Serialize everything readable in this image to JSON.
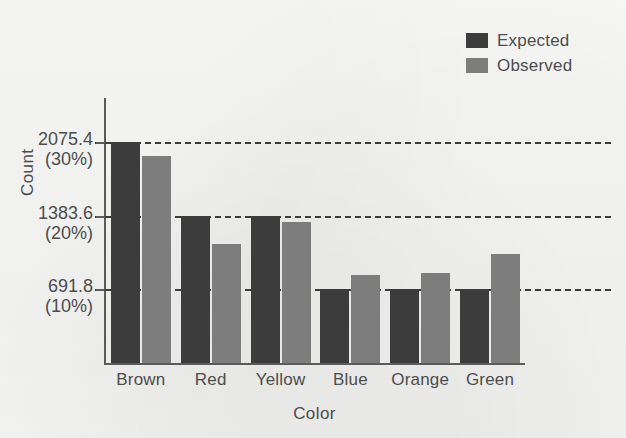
{
  "chart_data": {
    "type": "bar",
    "title": "",
    "xlabel": "Color",
    "ylabel": "Count",
    "categories": [
      "Brown",
      "Red",
      "Yellow",
      "Blue",
      "Orange",
      "Green"
    ],
    "series": [
      {
        "name": "Expected",
        "color": "#3c3c3c",
        "values": [
          2075.4,
          1383.6,
          1383.6,
          691.8,
          691.8,
          691.8
        ]
      },
      {
        "name": "Observed",
        "color": "#7d7d7d",
        "values": [
          1940,
          1120,
          1320,
          830,
          850,
          1020
        ]
      }
    ],
    "ylim": [
      0,
      2470
    ],
    "yticks": [
      {
        "value": 691.8,
        "value_label": "691.8",
        "percent_label": "(10%)"
      },
      {
        "value": 1383.6,
        "value_label": "1383.6",
        "percent_label": "(20%)"
      },
      {
        "value": 2075.4,
        "value_label": "2075.4",
        "percent_label": "(30%)"
      }
    ],
    "grid": "horizontal-dashed",
    "legend_position": "top-right"
  },
  "legend": {
    "entries": [
      {
        "label": "Expected",
        "color": "#3c3c3c"
      },
      {
        "label": "Observed",
        "color": "#7d7d7d"
      }
    ]
  },
  "axes": {
    "y_title": "Count",
    "x_title": "Color"
  }
}
